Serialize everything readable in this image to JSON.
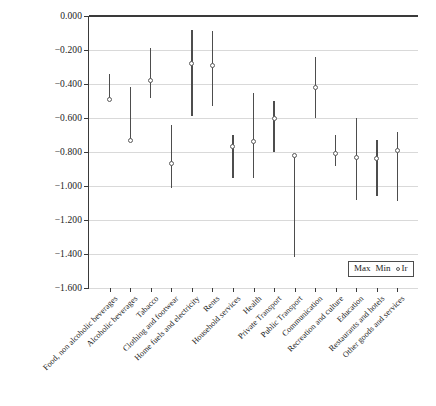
{
  "chart_data": {
    "type": "scatter",
    "title": "",
    "subtitle": "",
    "xlabel": "",
    "ylabel": "",
    "ylim": [
      -1.6,
      0.0
    ],
    "ytick_values": [
      0.0,
      -0.2,
      -0.4,
      -0.6,
      -0.8,
      -1.0,
      -1.2,
      -1.4,
      -1.6
    ],
    "ytick_labels": [
      "0.000",
      "−0.200",
      "−0.400",
      "−0.600",
      "−0.800",
      "−1.000",
      "−1.200",
      "−1.400",
      "−1.600"
    ],
    "grid": true,
    "legend_position": "bottom-right",
    "legend": [
      "Max",
      "Min",
      "Ir"
    ],
    "categories": [
      "Food, non alcoholic beverages",
      "Alcoholic beverages",
      "Tabacco",
      "Clothing and footwear",
      "Home fuels and electricity",
      "Rents",
      "Household services",
      "Health",
      "Private Transport",
      "Public Transport",
      "Communication",
      "Recreation and culture",
      "Education",
      "Restaurants and hotels",
      "Other goods and services"
    ],
    "series": [
      {
        "name": "Max",
        "values": [
          -0.34,
          -0.42,
          -0.19,
          -0.64,
          -0.08,
          -0.09,
          -0.7,
          -0.45,
          -0.5,
          -0.82,
          -0.24,
          -0.7,
          -0.6,
          -0.73,
          -0.68
        ]
      },
      {
        "name": "Min",
        "values": [
          -0.5,
          -0.73,
          -0.48,
          -1.01,
          -0.59,
          -0.53,
          -0.95,
          -0.95,
          -0.8,
          -1.42,
          -0.6,
          -0.88,
          -1.08,
          -1.06,
          -1.09
        ]
      },
      {
        "name": "Ir",
        "values": [
          -0.49,
          -0.73,
          -0.38,
          -0.87,
          -0.28,
          -0.29,
          -0.77,
          -0.74,
          -0.6,
          -0.82,
          -0.42,
          -0.81,
          -0.83,
          -0.84,
          -0.79
        ]
      }
    ]
  },
  "legend": {
    "max_label": "Max",
    "min_label": "Min",
    "ir_label": "Ir"
  }
}
